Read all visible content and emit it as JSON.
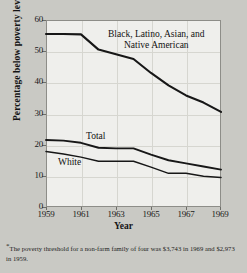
{
  "chart_data": {
    "type": "line",
    "title": "",
    "xlabel": "Year",
    "ylabel": "Percentage below poverty level",
    "xlim": [
      1959,
      1969
    ],
    "ylim": [
      0,
      60
    ],
    "grid": true,
    "legend_position": "inline-annotations",
    "x": [
      1959,
      1960,
      1961,
      1962,
      1963,
      1964,
      1965,
      1966,
      1967,
      1968,
      1969
    ],
    "xticks": [
      "1959",
      "1961",
      "1963",
      "1965",
      "1967",
      "1969"
    ],
    "yticks": [
      "0",
      "10",
      "20",
      "30",
      "40",
      "50",
      "60"
    ],
    "series": [
      {
        "name": "Black, Latino, Asian, and Native American",
        "values": [
          55.5,
          55.5,
          55.4,
          50.5,
          49.0,
          47.5,
          43.0,
          39.0,
          35.8,
          33.5,
          30.5
        ]
      },
      {
        "name": "Total",
        "values": [
          21.5,
          21.3,
          20.6,
          19.0,
          18.8,
          18.8,
          16.8,
          15.0,
          14.0,
          13.0,
          12.0
        ]
      },
      {
        "name": "White",
        "values": [
          17.8,
          17.0,
          16.0,
          14.7,
          14.7,
          14.7,
          12.8,
          10.8,
          10.8,
          9.9,
          9.5
        ]
      }
    ],
    "annotations": [
      {
        "id": "minority",
        "text_line1": "Black, Latino, Asian, and",
        "text_line2": "Native American"
      },
      {
        "id": "total",
        "text": "Total"
      },
      {
        "id": "white",
        "text": "White"
      }
    ],
    "footnote": {
      "marker": "*",
      "text": "The poverty threshold for a non-farm family of four was $3,743 in 1969 and $2,973 in 1959."
    },
    "colors": {
      "page_background": "#c9c9c4",
      "plot_background": "#efefec",
      "axis": "#8d8d88",
      "gridline": "#d6d6d0",
      "series_line": "#171717",
      "text": "#141414"
    }
  }
}
